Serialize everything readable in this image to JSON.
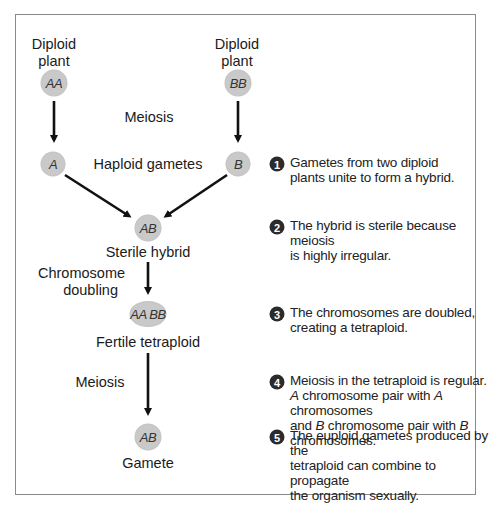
{
  "diagram": {
    "parents": {
      "left": {
        "label_line1": "Diploid",
        "label_line2": "plant",
        "genome": "AA"
      },
      "right": {
        "label_line1": "Diploid",
        "label_line2": "plant",
        "genome": "BB"
      }
    },
    "step_labels": {
      "meiosis_top": "Meiosis",
      "haploid_gametes": "Haploid gametes",
      "sterile_hybrid": "Sterile hybrid",
      "chromosome_doubling_line1": "Chromosome",
      "chromosome_doubling_line2": "doubling",
      "fertile_tetraploid": "Fertile tetraploid",
      "meiosis_bottom": "Meiosis",
      "gamete": "Gamete"
    },
    "nodes": {
      "gamete_a": "A",
      "gamete_b": "B",
      "hybrid": "AB",
      "tetraploid": "AA BB",
      "final_gamete": "AB"
    },
    "notes": [
      {
        "number": "1",
        "lines": [
          "Gametes from two diploid",
          "plants unite to form a hybrid."
        ]
      },
      {
        "number": "2",
        "lines": [
          "The hybrid is sterile because meiosis",
          "is highly irregular."
        ]
      },
      {
        "number": "3",
        "lines": [
          "The chromosomes are doubled,",
          "creating a tetraploid."
        ]
      },
      {
        "number": "4",
        "lines": [
          "Meiosis in the tetraploid is regular.",
          "A chromosome pair with A chromosomes",
          "and B chromosome pair with B chromosomes."
        ]
      },
      {
        "number": "5",
        "lines": [
          "The euploid gametes produced by the",
          "tetraploid can combine to propagate",
          "the organism sexually."
        ]
      }
    ],
    "note4_parts": {
      "line2_a1": "A",
      "line2_mid": " chromosome pair with ",
      "line2_a2": "A",
      "line2_end": " chromosomes",
      "line3_start": "and ",
      "line3_b1": "B",
      "line3_mid": " chromosome pair with ",
      "line3_b2": "B",
      "line3_end": " chromosomes."
    },
    "colors": {
      "node_fill": "#c9c9c9",
      "badge_fill": "#2b2b2b",
      "arrow": "#111111",
      "frame_border": "#8a8a8a"
    }
  }
}
